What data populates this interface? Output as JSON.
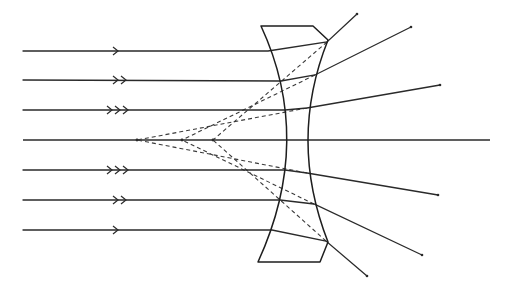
{
  "diagram": {
    "title": "",
    "colors": {
      "ink": "#2a2a2a",
      "background": "#ffffff"
    },
    "lens": {
      "type": "biconcave-thick",
      "outline": {
        "top_left": [
          261,
          26
        ],
        "top_right": [
          313,
          26
        ],
        "top_chamfer": [
          328,
          40
        ],
        "left_mid": [
          287,
          140
        ],
        "right_mid": [
          306,
          140
        ],
        "bottom_chamfer": [
          328,
          242
        ],
        "bottom_right": [
          320,
          262
        ],
        "bottom_left": [
          258,
          262
        ]
      }
    },
    "optical_axis": {
      "x1": 23,
      "x2": 490,
      "y": 140
    },
    "incident_rays": [
      {
        "y": 51,
        "arrow_count": 1,
        "arrow_x": 118,
        "hit_left": [
          268,
          51
        ],
        "hit_right": [
          327,
          42
        ],
        "out_end": [
          357,
          14
        ]
      },
      {
        "y": 80,
        "arrow_count": 2,
        "arrow_x": 118,
        "hit_left": [
          281,
          81
        ],
        "hit_right": [
          315,
          75
        ],
        "out_end": [
          411,
          27
        ]
      },
      {
        "y": 110,
        "arrow_count": 3,
        "arrow_x": 112,
        "hit_left": [
          285,
          110
        ],
        "hit_right": [
          307,
          108
        ],
        "out_end": [
          440,
          85
        ]
      },
      {
        "y": 140,
        "arrow_count": 0,
        "arrow_x": 0,
        "hit_left": [
          287,
          140
        ],
        "hit_right": [
          306,
          140
        ],
        "out_end": [
          490,
          140
        ]
      },
      {
        "y": 170,
        "arrow_count": 3,
        "arrow_x": 112,
        "hit_left": [
          285,
          170
        ],
        "hit_right": [
          307,
          173
        ],
        "out_end": [
          438,
          195
        ]
      },
      {
        "y": 200,
        "arrow_count": 2,
        "arrow_x": 118,
        "hit_left": [
          280,
          200
        ],
        "hit_right": [
          314,
          204
        ],
        "out_end": [
          422,
          255
        ]
      },
      {
        "y": 230,
        "arrow_count": 1,
        "arrow_x": 118,
        "hit_left": [
          272,
          230
        ],
        "hit_right": [
          326,
          241
        ],
        "out_end": [
          367,
          276
        ]
      }
    ],
    "virtual_focus_points": [
      {
        "label": "",
        "x": 137,
        "y": 140
      },
      {
        "label": "",
        "x": 182,
        "y": 140
      },
      {
        "label": "",
        "x": 213,
        "y": 140
      }
    ],
    "virtual_extensions": [
      {
        "from": [
          327,
          42
        ],
        "to": [
          213,
          140
        ]
      },
      {
        "from": [
          315,
          75
        ],
        "to": [
          182,
          140
        ]
      },
      {
        "from": [
          307,
          108
        ],
        "to": [
          137,
          140
        ]
      },
      {
        "from": [
          307,
          173
        ],
        "to": [
          137,
          140
        ]
      },
      {
        "from": [
          314,
          204
        ],
        "to": [
          182,
          140
        ]
      },
      {
        "from": [
          326,
          241
        ],
        "to": [
          213,
          140
        ]
      }
    ]
  }
}
